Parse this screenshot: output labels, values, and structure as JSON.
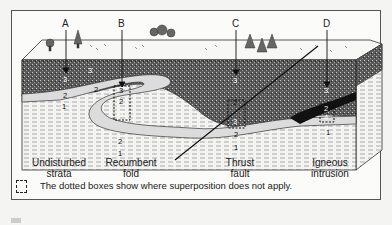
{
  "diagram": {
    "type": "geologic block cross-section",
    "columns": [
      {
        "letter": "A",
        "caption_line1": "Undisturbed",
        "caption_line2": "strata",
        "layers_top_to_bottom": [
          "3",
          "2",
          "1"
        ]
      },
      {
        "letter": "B",
        "caption_line1": "Recumbent",
        "caption_line2": "fold",
        "layers_top_to_bottom": [
          "3",
          "2",
          "3",
          "2",
          "1"
        ]
      },
      {
        "letter": "C",
        "caption_line1": "Thrust",
        "caption_line2": "fault",
        "layers_top_to_bottom": [
          "3",
          "2",
          "3",
          "2",
          "1"
        ]
      },
      {
        "letter": "D",
        "caption_line1": "Igneous",
        "caption_line2": "intrusion",
        "layers_top_to_bottom": [
          "3",
          "2",
          "4",
          "1"
        ]
      }
    ],
    "layer_labels": [
      "1",
      "2",
      "3",
      "4"
    ],
    "legend_note": "The dotted boxes show where superposition does not apply.",
    "colors": {
      "speckled_layer": "#555555",
      "light_layer": "#dcdcdc",
      "dashed_layer": "#f2f2f2",
      "surface": "#f6f6f4",
      "line": "#222222"
    }
  }
}
